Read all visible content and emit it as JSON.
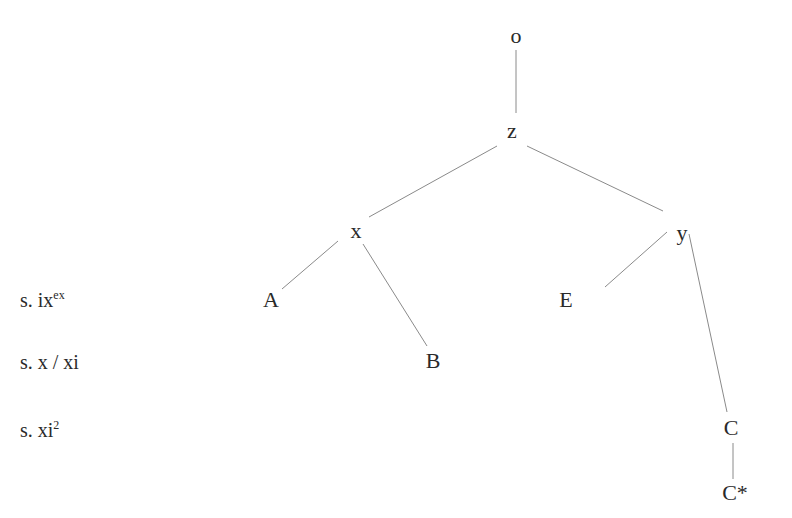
{
  "diagram": {
    "type": "tree",
    "nodes": [
      {
        "id": "o",
        "label": "o",
        "x": 516,
        "y": 36
      },
      {
        "id": "z",
        "label": "z",
        "x": 512,
        "y": 131
      },
      {
        "id": "x",
        "label": "x",
        "x": 356,
        "y": 231
      },
      {
        "id": "y",
        "label": "y",
        "x": 682,
        "y": 233
      },
      {
        "id": "A",
        "label": "A",
        "x": 271,
        "y": 300
      },
      {
        "id": "E",
        "label": "E",
        "x": 566,
        "y": 300
      },
      {
        "id": "B",
        "label": "B",
        "x": 433,
        "y": 361
      },
      {
        "id": "C",
        "label": "C",
        "x": 731,
        "y": 428
      },
      {
        "id": "Cstar",
        "label": "C*",
        "x": 735,
        "y": 493
      }
    ],
    "edges": [
      {
        "from": "o",
        "to": "z",
        "x1": 516,
        "y1": 50,
        "x2": 516,
        "y2": 113
      },
      {
        "from": "z",
        "to": "x",
        "x1": 497,
        "y1": 146,
        "x2": 369,
        "y2": 217
      },
      {
        "from": "z",
        "to": "y",
        "x1": 527,
        "y1": 146,
        "x2": 663,
        "y2": 211
      },
      {
        "from": "x",
        "to": "A",
        "x1": 338,
        "y1": 241,
        "x2": 282,
        "y2": 289
      },
      {
        "from": "x",
        "to": "B",
        "x1": 363,
        "y1": 244,
        "x2": 427,
        "y2": 346
      },
      {
        "from": "y",
        "to": "E",
        "x1": 667,
        "y1": 232,
        "x2": 605,
        "y2": 287
      },
      {
        "from": "y",
        "to": "C",
        "x1": 689,
        "y1": 234,
        "x2": 727,
        "y2": 412
      },
      {
        "from": "C",
        "to": "Cstar",
        "x1": 733,
        "y1": 443,
        "x2": 733,
        "y2": 479
      }
    ],
    "row_labels": [
      {
        "prefix": "s. ix",
        "sup": "ex",
        "y": 300
      },
      {
        "prefix": "s. x / xi",
        "sup": "",
        "y": 362
      },
      {
        "prefix": "s. xi",
        "sup": "2",
        "y": 430
      }
    ]
  }
}
